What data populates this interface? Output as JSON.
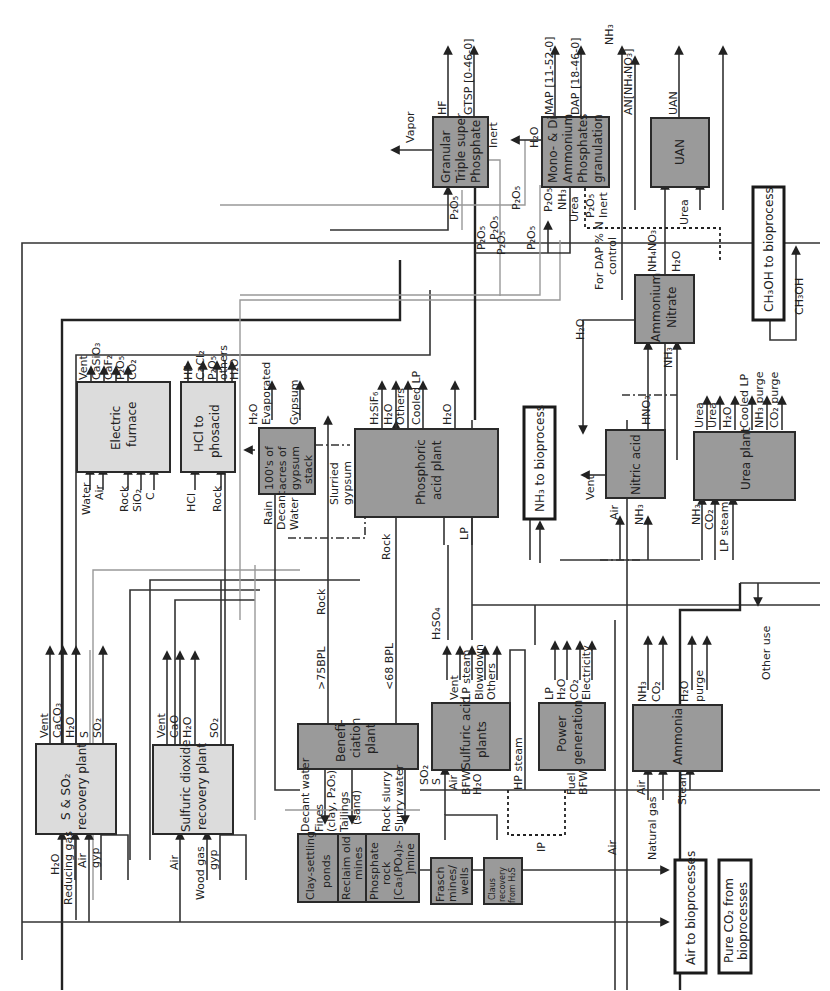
{
  "diagram": {
    "orientation": "rotated-90-ccw",
    "colors": {
      "unit_dark": "#9a9a9a",
      "unit_light": "#dcdcdc",
      "boundary_box": "#ffffff",
      "line": "#333333",
      "secondary_line": "#999999"
    },
    "units": {
      "gtsp": {
        "label1": "Granular",
        "label2": "Triple super",
        "label3": "Phosphate"
      },
      "map_dap": {
        "label1": "Mono- & Di-",
        "label2": "Ammonium",
        "label3": "Phosphates",
        "label4": "granulation"
      },
      "uan": {
        "label1": "UAN"
      },
      "electric_furnace": {
        "label1": "Electric",
        "label2": "furnace"
      },
      "hcl_phosacid": {
        "label1": "HCl to",
        "label2": "phosacid"
      },
      "gypsum_stack": {
        "label1": "100's of",
        "label2": "acres of",
        "label3": "gypsum",
        "label4": "stack"
      },
      "phosphoric_acid": {
        "label1": "Phosphoric",
        "label2": "acid plant"
      },
      "ammonium_nitrate": {
        "label1": "Ammonium",
        "label2": "Nitrate"
      },
      "nitric_acid": {
        "label1": "Nitric acid"
      },
      "urea_plant": {
        "label1": "Urea plant"
      },
      "s_so2_recovery": {
        "label1": "S & SO₂",
        "label2": "recovery plant"
      },
      "so2_recovery": {
        "label1": "Sulfuric dioxide",
        "label2": "recovery plant"
      },
      "beneficiation": {
        "label1": "Benefi-",
        "label2": "ciation",
        "label3": "plant"
      },
      "sulfuric_acid": {
        "label1": "Sulfuric acid",
        "label2": "plants"
      },
      "power_generation": {
        "label1": "Power",
        "label2": "generation"
      },
      "ammonia": {
        "label1": "Ammonia"
      },
      "clay_ponds": {
        "label1": "Clay-settling",
        "label2": "ponds"
      },
      "reclaim_mines": {
        "label1": "Reclaim old",
        "label2": "mines"
      },
      "phosphate_mine": {
        "label1": "Phosphate",
        "label2": "rock",
        "label3": "[Ca₃(PO₄)₂-",
        "label4": "]mine"
      },
      "frasch": {
        "label1": "Frasch",
        "label2": "mines/",
        "label3": "wells"
      },
      "claus": {
        "label1": "Claus",
        "label2": "recovery",
        "label3": "from H₂S"
      },
      "nh3_bio": {
        "label1": "NH₃ to bioprocess"
      },
      "ch3oh_bio": {
        "label1": "CH₃OH to bioprocess"
      },
      "air_bio": {
        "label1": "Air to bioprocesses"
      },
      "co2_bio": {
        "label1": "Pure CO₂ from",
        "label2": "bioprocesses"
      }
    },
    "streams": {
      "vapor": "Vapor",
      "hf": "HF",
      "gtsp_product": "GTSP [0-46-0]",
      "inert": "Inert",
      "h2o": "H₂O",
      "map_product": "MAP [11-52-0]",
      "dap_product": "DAP [18-46-0]",
      "nh3": "NH₃",
      "an_product": "AN[NH₄NO₃]",
      "uan_product": "UAN",
      "p2o5": "P₂O₅",
      "urea": "Urea",
      "dap_control_1": "For DAP % N",
      "dap_control_2": "control",
      "nh4no3": "NH₄NO₃",
      "ch3oh": "CH₃OH",
      "vent": "Vent",
      "casio3": "CaSiO₃",
      "caf2": "CaF₂",
      "co2": "CO₂",
      "water": "Water",
      "air": "Air",
      "rock": "Rock",
      "sio2": "SiO₂",
      "c": "C",
      "cacl2": "CaCl₂",
      "others": "others",
      "hcl": "HCl",
      "h2o_evap_1": "H₂O",
      "h2o_evap_2": "Evaporated",
      "gypsum": "Gypsum",
      "rain": "Rain",
      "decant": "Decant",
      "slurried_1": "Slurried",
      "slurried_2": "gypsum",
      "h2sif6": "H₂SiF₆",
      "others_cap": "Others",
      "cooled_lp": "Cooled LP",
      "lp": "LP",
      "hno3": "HNO₃",
      "lp_steam": "LP steam",
      "nh3_purge": "NH₃ purge",
      "co2_purge": "CO₂ purge",
      "caco3": "CaCO₃",
      "s": "S",
      "so2": "SO₂",
      "cao": "CaO",
      "reducing_gas": "Reducing gas",
      "gyp": "gyp",
      "wood_gas": "Wood gas",
      "gt75bpl": ">75BPL",
      "lt68bpl": "<68 BPL",
      "decant_water": "Decant water",
      "fines_1": "Fines",
      "fines_2": "(clay, P₂O₅)",
      "tailings_1": "Tailings",
      "tailings_2": "(sand)",
      "rock_slurry": "Rock slurry",
      "slurry_water": "Slurry water",
      "h2so4": "H₂SO₄",
      "blowdown": "Blowdown",
      "bfw": "BFW",
      "hp_steam": "HP steam",
      "electricity": "Electricity",
      "fuel": "Fuel",
      "purge": "purge",
      "steam": "Steam",
      "other_use": "Other use",
      "ip": "IP",
      "natural_gas": "Natural gas"
    }
  }
}
